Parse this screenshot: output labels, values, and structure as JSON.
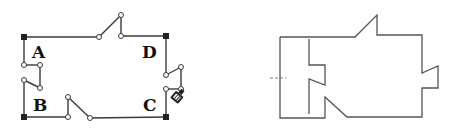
{
  "left_diagram": {
    "labels": {
      "A": "A",
      "B": "B",
      "C": "C",
      "D": "D"
    },
    "corners": [
      {
        "name": "top-left",
        "x": 24,
        "y": 37
      },
      {
        "name": "top-right",
        "x": 166,
        "y": 36
      },
      {
        "name": "bottom-left",
        "x": 24,
        "y": 117
      },
      {
        "name": "bottom-right",
        "x": 166,
        "y": 117
      }
    ],
    "cursor": "pen-hand-cursor-icon"
  },
  "right_diagram": {
    "description": "outline shape with notches and a dashed tick at left"
  },
  "colors": {
    "line": "#3a3a3a",
    "corner": "#222222",
    "outline": "#555555",
    "background": "#ffffff"
  }
}
